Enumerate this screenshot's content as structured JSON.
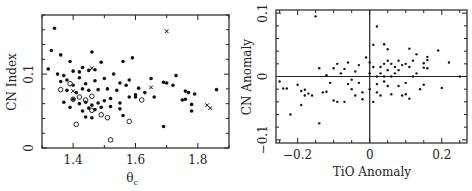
{
  "chart_data": [
    {
      "type": "scatter",
      "title": "",
      "xlabel": "θc",
      "ylabel": "CN Index",
      "xlim": [
        1.3,
        1.9
      ],
      "ylim": [
        0,
        0.18
      ],
      "xticks": [
        "1.4",
        "1.6",
        "1.8"
      ],
      "yticks": [
        "0",
        "0.1"
      ],
      "grid": false,
      "legend": null,
      "series": [
        {
          "name": "filled dots",
          "marker": "filled-circle",
          "points": [
            [
              1.34,
              0.162
            ],
            [
              1.33,
              0.132
            ],
            [
              1.36,
              0.126
            ],
            [
              1.46,
              0.13
            ],
            [
              1.49,
              0.116
            ],
            [
              1.56,
              0.117
            ],
            [
              1.59,
              0.122
            ],
            [
              1.32,
              0.107
            ],
            [
              1.35,
              0.1
            ],
            [
              1.37,
              0.098
            ],
            [
              1.39,
              0.117
            ],
            [
              1.4,
              0.104
            ],
            [
              1.42,
              0.103
            ],
            [
              1.43,
              0.109
            ],
            [
              1.45,
              0.105
            ],
            [
              1.47,
              0.106
            ],
            [
              1.36,
              0.09
            ],
            [
              1.38,
              0.092
            ],
            [
              1.4,
              0.085
            ],
            [
              1.42,
              0.095
            ],
            [
              1.44,
              0.087
            ],
            [
              1.47,
              0.091
            ],
            [
              1.5,
              0.094
            ],
            [
              1.53,
              0.1
            ],
            [
              1.55,
              0.088
            ],
            [
              1.58,
              0.092
            ],
            [
              1.61,
              0.081
            ],
            [
              1.65,
              0.094
            ],
            [
              1.38,
              0.078
            ],
            [
              1.41,
              0.075
            ],
            [
              1.43,
              0.08
            ],
            [
              1.45,
              0.078
            ],
            [
              1.48,
              0.079
            ],
            [
              1.51,
              0.08
            ],
            [
              1.54,
              0.078
            ],
            [
              1.57,
              0.085
            ],
            [
              1.6,
              0.072
            ],
            [
              1.63,
              0.075
            ],
            [
              1.66,
              0.069
            ],
            [
              1.37,
              0.062
            ],
            [
              1.4,
              0.066
            ],
            [
              1.42,
              0.06
            ],
            [
              1.44,
              0.062
            ],
            [
              1.46,
              0.058
            ],
            [
              1.48,
              0.061
            ],
            [
              1.5,
              0.064
            ],
            [
              1.52,
              0.067
            ],
            [
              1.55,
              0.061
            ],
            [
              1.58,
              0.069
            ],
            [
              1.6,
              0.069
            ],
            [
              1.39,
              0.055
            ],
            [
              1.43,
              0.05
            ],
            [
              1.45,
              0.054
            ],
            [
              1.47,
              0.052
            ],
            [
              1.49,
              0.055
            ],
            [
              1.52,
              0.056
            ],
            [
              1.55,
              0.053
            ],
            [
              1.44,
              0.042
            ],
            [
              1.46,
              0.041
            ],
            [
              1.56,
              0.044
            ],
            [
              1.69,
              0.089
            ],
            [
              1.7,
              0.088
            ],
            [
              1.72,
              0.085
            ],
            [
              1.73,
              0.098
            ],
            [
              1.75,
              0.065
            ],
            [
              1.76,
              0.077
            ],
            [
              1.76,
              0.066
            ],
            [
              1.77,
              0.075
            ],
            [
              1.78,
              0.059
            ],
            [
              1.78,
              0.05
            ],
            [
              1.79,
              0.073
            ],
            [
              1.86,
              0.079
            ],
            [
              1.69,
              0.029
            ]
          ]
        },
        {
          "name": "open circles",
          "marker": "open-circle",
          "points": [
            [
              1.36,
              0.079
            ],
            [
              1.39,
              0.087
            ],
            [
              1.4,
              0.066
            ],
            [
              1.42,
              0.069
            ],
            [
              1.44,
              0.065
            ],
            [
              1.46,
              0.07
            ],
            [
              1.46,
              0.051
            ],
            [
              1.49,
              0.045
            ],
            [
              1.51,
              0.041
            ],
            [
              1.58,
              0.036
            ],
            [
              1.62,
              0.065
            ],
            [
              1.41,
              0.032
            ],
            [
              1.52,
              0.011
            ]
          ]
        },
        {
          "name": "crosses",
          "marker": "x",
          "points": [
            [
              1.7,
              0.158
            ],
            [
              1.83,
              0.058
            ],
            [
              1.84,
              0.054
            ],
            [
              1.65,
              0.082
            ],
            [
              1.46,
              0.108
            ],
            [
              1.4,
              0.077
            ]
          ]
        }
      ]
    },
    {
      "type": "scatter",
      "title": "",
      "xlabel": "TiO Anomaly",
      "ylabel": "CN Anomaly",
      "xlim": [
        -0.26,
        0.27
      ],
      "ylim": [
        -0.105,
        0.105
      ],
      "xticks": [
        "-0.2",
        "0",
        "0.2"
      ],
      "yticks": [
        "-0.1",
        "0",
        "0.1"
      ],
      "grid": false,
      "zero_lines": true,
      "legend": null,
      "series": [
        {
          "name": "dots",
          "marker": "filled-dot",
          "points": [
            [
              -0.15,
              0.095
            ],
            [
              0.02,
              0.079
            ],
            [
              -0.14,
              0.013
            ],
            [
              0.01,
              0.05
            ],
            [
              0.04,
              0.051
            ],
            [
              0.05,
              0.043
            ],
            [
              0.11,
              0.044
            ],
            [
              0.19,
              0.041
            ],
            [
              0.13,
              0.035
            ],
            [
              0.16,
              0.031
            ],
            [
              0.16,
              0.026
            ],
            [
              0.15,
              0.021
            ],
            [
              0.22,
              0.022
            ],
            [
              0.15,
              0.014
            ],
            [
              0.16,
              0.013
            ],
            [
              0.25,
              0.0
            ],
            [
              -0.25,
              -0.008
            ],
            [
              -0.24,
              -0.019
            ],
            [
              -0.23,
              -0.019
            ],
            [
              -0.2,
              -0.013
            ],
            [
              -0.19,
              -0.023
            ],
            [
              -0.18,
              -0.021
            ],
            [
              -0.18,
              -0.03
            ],
            [
              -0.17,
              -0.027
            ],
            [
              -0.16,
              -0.03
            ],
            [
              -0.19,
              -0.045
            ],
            [
              -0.22,
              -0.06
            ],
            [
              -0.14,
              -0.074
            ],
            [
              -0.13,
              -0.025
            ],
            [
              -0.12,
              -0.024
            ],
            [
              -0.1,
              -0.038
            ],
            [
              -0.09,
              -0.04
            ],
            [
              -0.07,
              -0.04
            ],
            [
              -0.11,
              -0.01
            ],
            [
              -0.12,
              0.002
            ],
            [
              -0.1,
              0.013
            ],
            [
              -0.09,
              0.02
            ],
            [
              -0.08,
              0.005
            ],
            [
              -0.07,
              0.012
            ],
            [
              -0.06,
              0.022
            ],
            [
              -0.05,
              -0.005
            ],
            [
              -0.04,
              0.008
            ],
            [
              -0.03,
              0.018
            ],
            [
              -0.03,
              -0.01
            ],
            [
              -0.02,
              -0.025
            ],
            [
              -0.02,
              -0.036
            ],
            [
              -0.01,
              0.03
            ],
            [
              0.0,
              0.022
            ],
            [
              0.0,
              0.005
            ],
            [
              0.0,
              -0.02
            ],
            [
              0.01,
              -0.04
            ],
            [
              0.01,
              0.015
            ],
            [
              0.02,
              0.0
            ],
            [
              0.02,
              -0.025
            ],
            [
              0.03,
              0.015
            ],
            [
              0.03,
              0.005
            ],
            [
              0.03,
              -0.03
            ],
            [
              0.04,
              0.02
            ],
            [
              0.04,
              0.0
            ],
            [
              0.05,
              0.025
            ],
            [
              0.05,
              0.01
            ],
            [
              0.05,
              -0.015
            ],
            [
              0.06,
              0.02
            ],
            [
              0.06,
              0.0
            ],
            [
              0.06,
              -0.028
            ],
            [
              0.07,
              0.015
            ],
            [
              0.07,
              0.005
            ],
            [
              0.08,
              0.025
            ],
            [
              0.08,
              0.01
            ],
            [
              0.09,
              0.018
            ],
            [
              0.09,
              -0.03
            ],
            [
              0.1,
              0.02
            ],
            [
              0.1,
              -0.01
            ],
            [
              0.11,
              0.015
            ],
            [
              0.11,
              -0.035
            ],
            [
              0.12,
              0.025
            ],
            [
              0.12,
              0.0
            ],
            [
              0.13,
              0.005
            ],
            [
              0.14,
              -0.02
            ],
            [
              0.15,
              -0.013
            ],
            [
              0.2,
              -0.018
            ],
            [
              -0.05,
              -0.02
            ],
            [
              -0.06,
              -0.012
            ],
            [
              -0.04,
              -0.03
            ],
            [
              0.02,
              -0.012
            ],
            [
              0.04,
              -0.008
            ],
            [
              0.08,
              -0.015
            ],
            [
              0.1,
              -0.028
            ]
          ]
        }
      ]
    }
  ],
  "panels": {
    "left": {
      "xlabel": "θ",
      "xlabel_sub": "c",
      "ylabel": "CN Index",
      "xticks": [
        {
          "v": 1.4,
          "label": "1.4"
        },
        {
          "v": 1.6,
          "label": "1.6"
        },
        {
          "v": 1.8,
          "label": "1.8"
        }
      ],
      "yticks": [
        {
          "v": 0,
          "label": "0"
        },
        {
          "v": 0.1,
          "label": "0.1"
        }
      ]
    },
    "right": {
      "xlabel": "TiO Anomaly",
      "ylabel": "CN Anomaly",
      "xticks": [
        {
          "v": -0.2,
          "label": "−0.2"
        },
        {
          "v": 0,
          "label": "0"
        },
        {
          "v": 0.2,
          "label": "0.2"
        }
      ],
      "yticks": [
        {
          "v": -0.1,
          "label": "−0.1"
        },
        {
          "v": 0,
          "label": "0"
        },
        {
          "v": 0.1,
          "label": "0.1"
        }
      ]
    }
  }
}
